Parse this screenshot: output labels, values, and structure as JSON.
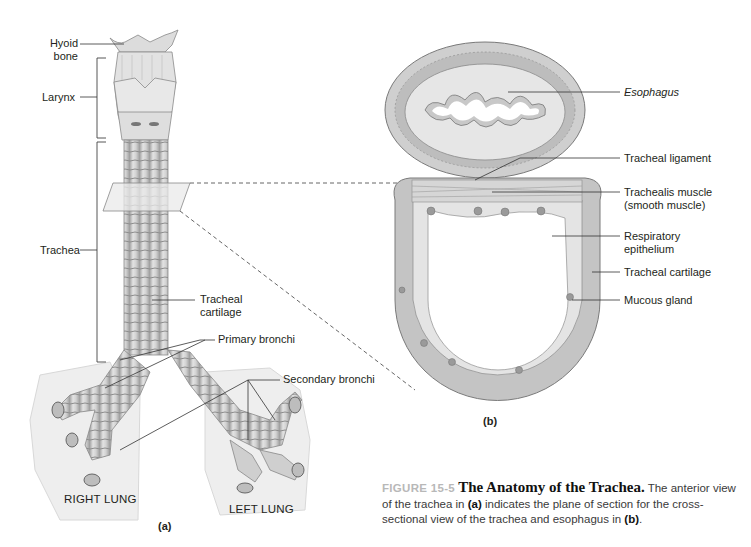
{
  "figure": {
    "number_label": "FIGURE 15-5",
    "title": "The Anatomy of the Trachea.",
    "caption_part1": " The anterior view of the trachea in ",
    "caption_ref_a": "(a)",
    "caption_part2": " indicates the plane of section for the cross-sectional view of the trachea and esophagus in ",
    "caption_ref_b": "(b)",
    "caption_part3": "."
  },
  "panel_a": {
    "tag": "(a)",
    "labels": {
      "hyoid_line1": "Hyoid",
      "hyoid_line2": "bone",
      "larynx": "Larynx",
      "trachea": "Trachea",
      "tracheal_cartilage_line1": "Tracheal",
      "tracheal_cartilage_line2": "cartilage",
      "primary_bronchi": "Primary bronchi",
      "secondary_bronchi": "Secondary bronchi",
      "right_lung": "RIGHT LUNG",
      "left_lung": "LEFT LUNG"
    }
  },
  "panel_b": {
    "tag": "(b)",
    "labels": {
      "esophagus": "Esophagus",
      "tracheal_ligament": "Tracheal ligament",
      "trachealis_line1": "Trachealis muscle",
      "trachealis_line2": "(smooth muscle)",
      "resp_epi_line1": "Respiratory",
      "resp_epi_line2": "epithelium",
      "tracheal_cartilage": "Tracheal cartilage",
      "mucous_gland": "Mucous gland"
    }
  },
  "colors": {
    "tissue_light": "#e6e6e6",
    "tissue_mid": "#c9c9c9",
    "tissue_dark": "#8a8a8a",
    "lung_bg": "#ededed",
    "figure_label": "#b8b8b8"
  }
}
